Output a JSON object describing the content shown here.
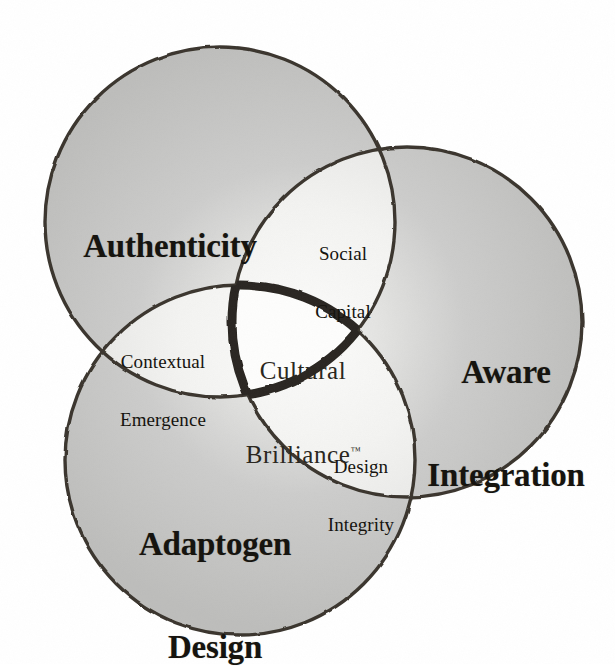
{
  "diagram": {
    "type": "venn-3-circle",
    "title": "Cultural Brilliance",
    "background_color": "#ffffff",
    "circle_fill_color": "#c3c3c3",
    "circle_fill_light_color": "#efefef",
    "overlap_fill_color": "#f2f2f0",
    "center_fill_color": "#fdfdfc",
    "stroke_color": "#3a362e",
    "text_color": "#16140f"
  },
  "primary_sets": [
    {
      "id": "authenticity",
      "label": "Authenticity",
      "lines": [
        "Authenticity"
      ],
      "position": "top-left"
    },
    {
      "id": "aware-integration",
      "label": "Aware Integration",
      "lines": [
        "Aware",
        "Integration"
      ],
      "position": "right"
    },
    {
      "id": "adaptogen-design",
      "label": "Adaptogen Design",
      "lines": [
        "Adaptogen",
        "Design"
      ],
      "position": "bottom-left"
    }
  ],
  "overlaps": [
    {
      "id": "social-capital",
      "label": "Social Capital",
      "lines": [
        "Social",
        "Capital"
      ],
      "between": [
        "Authenticity",
        "Aware Integration"
      ]
    },
    {
      "id": "contextual-emergence",
      "label": "Contextual Emergence",
      "lines": [
        "Contextual",
        "Emergence"
      ],
      "between": [
        "Authenticity",
        "Adaptogen Design"
      ]
    },
    {
      "id": "design-integrity",
      "label": "Design Integrity",
      "lines": [
        "Design",
        "Integrity"
      ],
      "between": [
        "Aware Integration",
        "Adaptogen Design"
      ]
    }
  ],
  "center": {
    "id": "cultural-brilliance",
    "label": "Cultural Brilliance",
    "lines": [
      "Cultural",
      "Brilliance"
    ],
    "trademark": "™"
  }
}
